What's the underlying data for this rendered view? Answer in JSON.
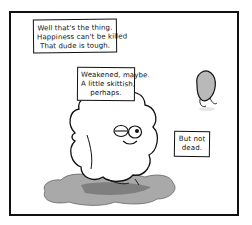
{
  "comic": {
    "panel": {
      "border_color": "#111111",
      "background": "#ffffff"
    },
    "captions": [
      {
        "lines": [
          "Well that's the thing.",
          "Happiness can't be killed",
          "That dude is tough."
        ]
      },
      {
        "lines": [
          "Weakened, maybe.",
          "A little skittish,",
          "perhaps."
        ]
      },
      {
        "lines": [
          "But not",
          "dead."
        ]
      }
    ],
    "characters": [
      {
        "name": "happiness-cloud",
        "description": "fluffy white cloud creature with one squinting eye and one round eye, smiling, sitting in a grey puddle"
      },
      {
        "name": "small-grey-creature",
        "description": "small grey bean-shaped figure peeking from the right"
      }
    ],
    "colors": {
      "puddle": "#a9a9a9",
      "puddle_shadow": "#6e6e6e",
      "creature_grey": "#b9b9b9",
      "ink": "#111111"
    }
  }
}
